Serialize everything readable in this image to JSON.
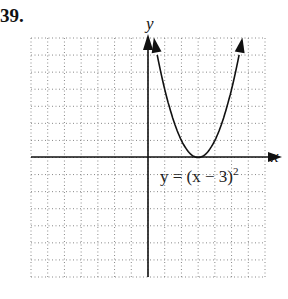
{
  "problem_number": "39.",
  "chart_data": {
    "type": "line",
    "title": "",
    "xlabel": "x",
    "ylabel": "y",
    "xlim": [
      -7,
      7
    ],
    "ylim": [
      -7,
      7
    ],
    "grid": true,
    "grid_style": "dotted",
    "series": [
      {
        "name": "y = (x − 3)²",
        "equation": "y = (x - 3)^2",
        "x": [
          0.35,
          1,
          2,
          3,
          4,
          5,
          5.65
        ],
        "y": [
          7,
          4,
          1,
          0,
          1,
          4,
          7
        ],
        "vertex": [
          3,
          0
        ],
        "arrows_at_ends": true
      }
    ],
    "annotations": [
      {
        "text": "y = (x − 3)²",
        "x": 3,
        "y": -1.1
      }
    ]
  },
  "labels": {
    "x_axis": "x",
    "y_axis": "y",
    "equation_base": "y = (x − 3)",
    "equation_exp": "2"
  }
}
